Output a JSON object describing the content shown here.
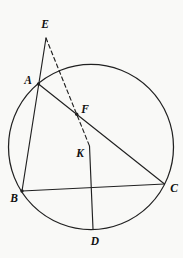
{
  "figure": {
    "width": 183,
    "height": 258,
    "background": "#f9f9f7",
    "line_color": "#212121",
    "label_color": "#101010",
    "stroke_width": 1.15,
    "circle": {
      "cx": 91,
      "cy": 147,
      "r": 82.5
    },
    "points": {
      "E": {
        "x": 46,
        "y": 38
      },
      "A": {
        "x": 38.5,
        "y": 84
      },
      "F": {
        "x": 76.7,
        "y": 114.3
      },
      "K": {
        "x": 89.5,
        "y": 146
      },
      "B": {
        "x": 22,
        "y": 191
      },
      "C": {
        "x": 164.5,
        "y": 184
      },
      "D": {
        "x": 93,
        "y": 229
      }
    },
    "labels": {
      "E": {
        "text": "E",
        "x": 45,
        "y": 24
      },
      "A": {
        "text": "A",
        "x": 28,
        "y": 80
      },
      "F": {
        "text": "F",
        "x": 85,
        "y": 109
      },
      "K": {
        "text": "K",
        "x": 80,
        "y": 153
      },
      "B": {
        "text": "B",
        "x": 14,
        "y": 198
      },
      "C": {
        "text": "C",
        "x": 174,
        "y": 188
      },
      "D": {
        "text": "D",
        "x": 95,
        "y": 241
      }
    },
    "segments": [
      {
        "from": "E",
        "to": "B",
        "style": "solid"
      },
      {
        "from": "A",
        "to": "C",
        "style": "solid"
      },
      {
        "from": "B",
        "to": "C",
        "style": "solid"
      },
      {
        "from": "D",
        "to": "K",
        "style": "solid"
      },
      {
        "from": "E",
        "to": "K",
        "style": "dashed"
      }
    ],
    "dots": [
      "A",
      "B",
      "F"
    ],
    "dot_radius": 1.7,
    "dash_pattern": "4 3"
  }
}
